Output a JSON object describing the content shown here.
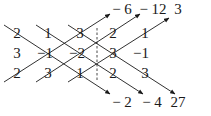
{
  "diagram": {
    "type": "sarrus-rule-determinant",
    "matrix": [
      [
        "2",
        "1",
        "3"
      ],
      [
        "3",
        "−1",
        "−2"
      ],
      [
        "2",
        "3",
        "1"
      ]
    ],
    "extended_columns": [
      [
        "2",
        "1"
      ],
      [
        "3",
        "−1"
      ],
      [
        "2",
        "3"
      ]
    ],
    "grid": [
      [
        "2",
        "1",
        "3",
        "2",
        "1"
      ],
      [
        "3",
        "−1",
        "−2",
        "3",
        "−1"
      ],
      [
        "2",
        "3",
        "1",
        "2",
        "3"
      ]
    ],
    "top_products": [
      "− 6",
      "− 12",
      "3"
    ],
    "bottom_products": [
      "− 2",
      "− 4",
      "27"
    ],
    "colors": {
      "line": "#1a1a1a",
      "background": "#ffffff"
    }
  }
}
